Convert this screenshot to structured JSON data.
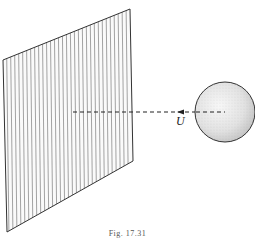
{
  "figure": {
    "caption": "Fig. 17.31",
    "velocity_label": "U",
    "plate": {
      "corners": [
        [
          3,
          60
        ],
        [
          130,
          9
        ],
        [
          133,
          161
        ],
        [
          7,
          232
        ]
      ],
      "hatch": "vertical-lines",
      "stroke": "#333333"
    },
    "sphere": {
      "cx": 225,
      "cy": 112,
      "r": 30,
      "fill": "#e6e6e6",
      "stroke": "#333333"
    },
    "trajectory": {
      "style": "dashed",
      "from": [
        225,
        112
      ],
      "to": [
        73,
        112
      ],
      "arrow_at": [
        180,
        112
      ],
      "direction": "toward-plate"
    }
  }
}
